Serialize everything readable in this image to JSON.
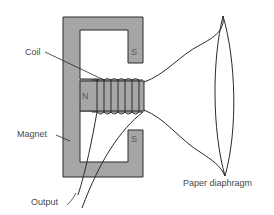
{
  "diagram": {
    "type": "moving-coil loudspeaker cross-section",
    "labels": {
      "coil": "Coil",
      "magnet": "Magnet",
      "output": "Output",
      "diaphragm": "Paper diaphragm"
    },
    "poles": {
      "north": "N",
      "south_top": "S",
      "south_bottom": "S"
    },
    "colors": {
      "magnet_fill": "#a6a6a6",
      "line": "#2a2a2a",
      "text": "#4a4a4a",
      "background": "#ffffff"
    }
  }
}
